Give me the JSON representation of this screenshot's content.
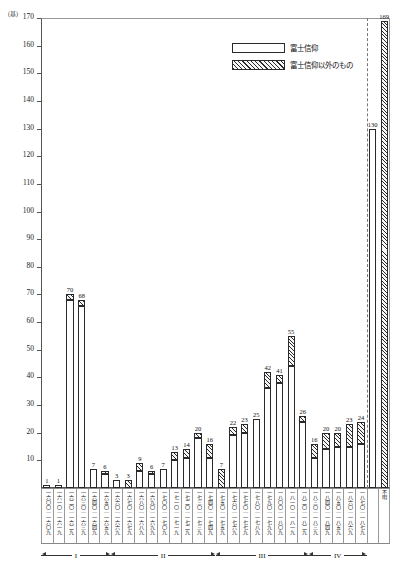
{
  "chart_data": {
    "type": "bar",
    "title": "",
    "subtitle": "",
    "xlabel": "",
    "ylabel": "",
    "unit_label": "(基)",
    "ylim": [
      0,
      170
    ],
    "ytick_step": 10,
    "yticks": [
      0,
      10,
      20,
      30,
      40,
      50,
      60,
      70,
      80,
      90,
      100,
      110,
      120,
      130,
      140,
      150,
      160,
      170
    ],
    "grid": false,
    "stacked": true,
    "legend_position": "top-right",
    "series": [
      {
        "name": "富士信仰",
        "fill": "white",
        "values": [
          1,
          1,
          68,
          66,
          7,
          5,
          3,
          0,
          6,
          5,
          7,
          10,
          11,
          18,
          11,
          0,
          19,
          20,
          25,
          36,
          38,
          44,
          24,
          11,
          14,
          15,
          15,
          16,
          130,
          0
        ]
      },
      {
        "name": "富士信仰以外のもの",
        "fill": "hatched",
        "values": [
          0,
          0,
          2,
          2,
          0,
          1,
          0,
          3,
          3,
          1,
          0,
          3,
          3,
          2,
          5,
          7,
          3,
          3,
          0,
          6,
          3,
          11,
          2,
          5,
          6,
          5,
          8,
          8,
          0,
          169
        ]
      }
    ],
    "totals": [
      1,
      1,
      70,
      68,
      7,
      6,
      3,
      3,
      9,
      6,
      7,
      13,
      14,
      20,
      16,
      7,
      22,
      23,
      25,
      42,
      41,
      55,
      26,
      16,
      20,
      20,
      23,
      24,
      130,
      169
    ],
    "categories": [
      "一六〇〇｜一六〇九",
      "一六一〇｜一六一九",
      "一六二〇｜一六二九",
      "一六三〇｜一六三九",
      "一六四〇｜一六四九",
      "一六五〇｜一六五九",
      "一六六〇｜一六六九",
      "一六七〇｜一六七九",
      "一六八〇｜一六八九",
      "一六九〇｜一六九九",
      "一七〇〇｜一七〇九",
      "一七一〇｜一七一九",
      "一七二〇｜一七二九",
      "一七三〇｜一七三九",
      "一七四〇｜一七四九",
      "一七五〇｜一七五九",
      "一七六〇｜一七六九",
      "一七七〇｜一七七九",
      "一七八〇｜一七八九",
      "一七九〇｜一七九九",
      "一八〇〇｜一八〇九",
      "一八一〇｜一八一九",
      "一八二〇｜一八二九",
      "一八三〇｜一八三九",
      "一八四〇｜一八四九",
      "一八五〇｜一八五九",
      "一八六〇｜一八六九",
      "一八七〇｜一八七九",
      "",
      "不明"
    ],
    "annotations": [
      {
        "label": "130",
        "bar_index": 28
      },
      {
        "label": "169",
        "bar_index": 29
      }
    ]
  },
  "legend": {
    "items": [
      {
        "label": "富士信仰",
        "swatch": "white"
      },
      {
        "label": "富士信仰以外のもの",
        "swatch": "hatch"
      }
    ]
  },
  "periods": [
    {
      "name": "I",
      "start_index": 0,
      "end_index": 5
    },
    {
      "name": "II",
      "start_index": 6,
      "end_index": 14
    },
    {
      "name": "III",
      "start_index": 15,
      "end_index": 22
    },
    {
      "name": "IV",
      "start_index": 23,
      "end_index": 27
    }
  ],
  "axis": {
    "unit": "(基)",
    "dashed_separator_after_index": 27
  }
}
